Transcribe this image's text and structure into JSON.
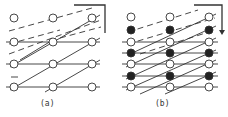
{
  "figure": {
    "panels": [
      {
        "label": "(a)",
        "columns_x": [
          14,
          53,
          92
        ],
        "rows_y": [
          18,
          42,
          64,
          87
        ],
        "filled_rows": [],
        "corner_bracket": "open-corner",
        "description": "4 rows x 3 columns of hollow nodes with solid horizontal lines, solid diagonals, and dashed diagonals in the upper region"
      },
      {
        "label": "(b)",
        "columns_x": [
          131,
          170,
          209
        ],
        "rows_y": [
          17,
          30,
          42,
          53,
          64,
          76,
          87
        ],
        "filled_rows": [
          1,
          3,
          5
        ],
        "corner_bracket": "arrow-down",
        "description": "7 rows x 3 columns of alternating hollow and filled nodes with horizontal lines, dense diagonals, dashed diagonals at top"
      }
    ],
    "colors": {
      "line": "#333333",
      "node_fill": "#222222",
      "node_hollow": "#ffffff"
    }
  }
}
